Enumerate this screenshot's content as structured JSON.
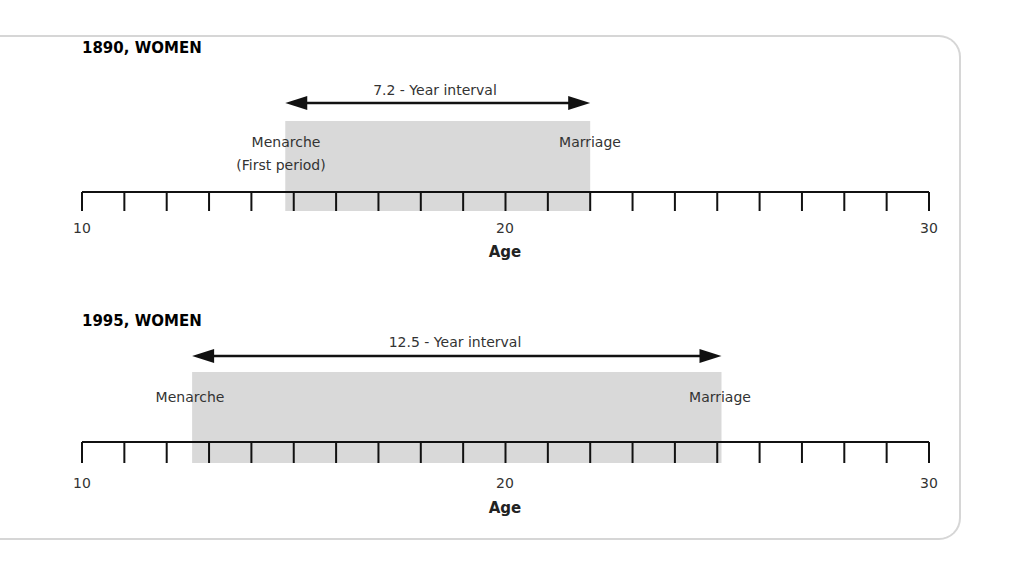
{
  "chart_data": {
    "type": "timeline",
    "xlabel": "Age",
    "xlim": [
      10,
      30
    ],
    "major_ticks": [
      10,
      20,
      30
    ],
    "minor_tick_step": 1,
    "panels": [
      {
        "title": "1890, WOMEN",
        "interval_label": "7.2 - Year interval",
        "start_age": 14.8,
        "end_age": 22.0,
        "start_label": "Menarche",
        "start_sublabel": "(First period)",
        "end_label": "Marriage",
        "xlabel": "Age",
        "tick_labels": [
          "10",
          "20",
          "30"
        ]
      },
      {
        "title": "1995, WOMEN",
        "interval_label": "12.5 - Year interval",
        "start_age": 12.6,
        "end_age": 25.1,
        "start_label": "Menarche",
        "start_sublabel": "",
        "end_label": "Marriage",
        "xlabel": "Age",
        "tick_labels": [
          "10",
          "20",
          "30"
        ]
      }
    ],
    "colors": {
      "shade": "#d9d9d9",
      "axis": "#111111",
      "border": "#d6d6d6"
    }
  }
}
